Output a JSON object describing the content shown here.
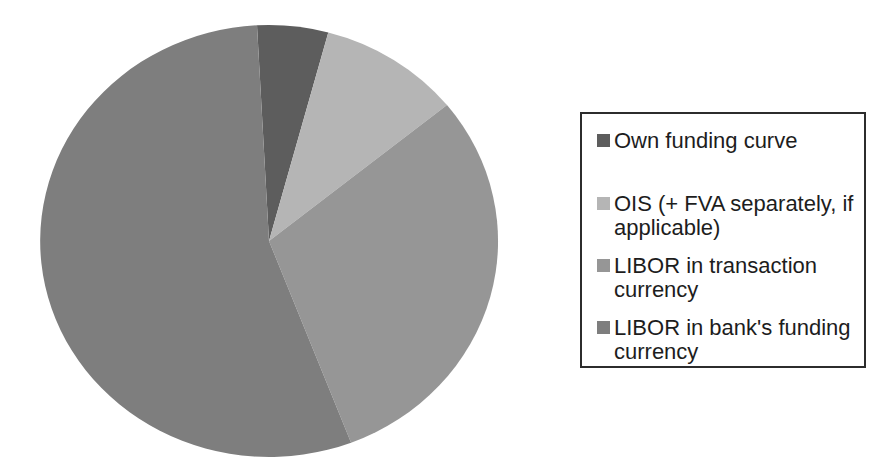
{
  "page": {
    "background": "#ffffff"
  },
  "chart_data": {
    "type": "pie",
    "title": "",
    "labels": [
      "Own funding curve",
      "OIS (+ FVA separately, if applicable)",
      "LIBOR in transaction currency",
      "LIBOR in bank's funding currency"
    ],
    "values": [
      5,
      10,
      30,
      55
    ],
    "colors": [
      "#5d5d5d",
      "#b5b5b5",
      "#969696",
      "#7e7e7e"
    ],
    "legend_position": "right",
    "start_angle_deg": -3,
    "direction": "clockwise",
    "data_labels_shown": false
  },
  "legend": {
    "border_color": "#2c2c2c",
    "items": [
      {
        "label": "Own funding curve",
        "lines": [
          "Own funding curve"
        ]
      },
      {
        "label": "OIS (+ FVA separately, if applicable)",
        "lines": [
          "OIS (+ FVA separately, if",
          "applicable)"
        ]
      },
      {
        "label": "LIBOR in transaction currency",
        "lines": [
          "LIBOR in transaction",
          "currency"
        ]
      },
      {
        "label": "LIBOR in bank's funding currency",
        "lines": [
          "LIBOR in bank's funding",
          "currency"
        ]
      }
    ]
  }
}
